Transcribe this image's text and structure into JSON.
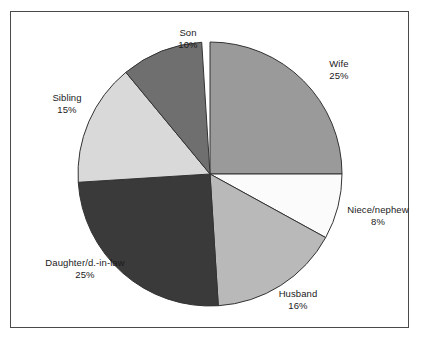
{
  "figure": {
    "background_color": "#ffffff",
    "frame_color": "#4a4a4a"
  },
  "chart_data": {
    "type": "pie",
    "title": "",
    "subtitle": "",
    "xlabel": "",
    "ylabel": "",
    "legend_position": "none",
    "grid": false,
    "start_angle_deg": 90,
    "direction": "clockwise",
    "center": {
      "x": 210,
      "y": 174
    },
    "radius": 132,
    "categories": [
      "Wife",
      "Niece/nephew",
      "Husband",
      "Daughter/d.-in-law",
      "Sibling",
      "Son"
    ],
    "values": [
      25,
      8,
      16,
      25,
      15,
      10
    ],
    "value_labels": [
      "25%",
      "8%",
      "16%",
      "25%",
      "15%",
      "10%"
    ],
    "slice_colors": [
      "#9a9a9a",
      "#fbfbfb",
      "#b9b9b9",
      "#3a3a3a",
      "#d9d9d9",
      "#6f6f6f"
    ],
    "slice_edge_color": "#333333",
    "slices": [
      {
        "name": "Wife",
        "label": "Wife",
        "value": 25,
        "value_label": "25%",
        "color": "#9a9a9a",
        "sweep_deg": 90,
        "start_deg": 0,
        "end_deg": 90
      },
      {
        "name": "Niece/nephew",
        "label": "Niece/nephew",
        "value": 8,
        "value_label": "8%",
        "color": "#fbfbfb",
        "sweep_deg": 28.8,
        "start_deg": 90,
        "end_deg": 118.8
      },
      {
        "name": "Husband",
        "label": "Husband",
        "value": 16,
        "value_label": "16%",
        "color": "#b9b9b9",
        "sweep_deg": 57.6,
        "start_deg": 118.8,
        "end_deg": 176.4
      },
      {
        "name": "Daughter/d.-in-law",
        "label": "Daughter/d.-in-law",
        "value": 25,
        "value_label": "25%",
        "color": "#3a3a3a",
        "sweep_deg": 90,
        "start_deg": 176.4,
        "end_deg": 266.4
      },
      {
        "name": "Sibling",
        "label": "Sibling",
        "value": 15,
        "value_label": "15%",
        "color": "#d9d9d9",
        "sweep_deg": 54,
        "start_deg": 266.4,
        "end_deg": 320.4
      },
      {
        "name": "Son",
        "label": "Son",
        "value": 10,
        "value_label": "10%",
        "color": "#6f6f6f",
        "sweep_deg": 36,
        "start_deg": 320.4,
        "end_deg": 356.4
      }
    ]
  }
}
